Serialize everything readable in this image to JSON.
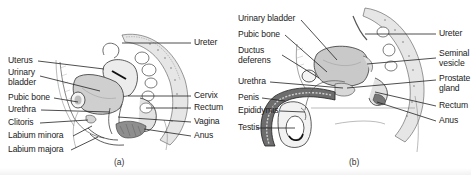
{
  "figure": {
    "panel_a": {
      "caption": "(a)",
      "subject": "female-pelvis-sagittal",
      "labels_left": [
        "Uterus",
        "Urinary bladder",
        "Pubic bone",
        "Urethra",
        "Clitoris",
        "Labium minora",
        "Labium majora"
      ],
      "labels_right": [
        "Ureter",
        "Cervix",
        "Rectum",
        "Vagina",
        "Anus"
      ],
      "urinary_line1": "Urinary",
      "urinary_line2": "bladder"
    },
    "panel_b": {
      "caption": "(b)",
      "subject": "male-pelvis-sagittal",
      "labels_left": [
        "Urinary bladder",
        "Pubic bone",
        "Ductus deferens",
        "Urethra",
        "Penis",
        "Epididymis",
        "Testis"
      ],
      "labels_right": [
        "Ureter",
        "Seminal vesicle",
        "Prostate gland",
        "Rectum",
        "Anus"
      ],
      "ductus_line1": "Ductus",
      "ductus_line2": "deferens",
      "seminal_line1": "Seminal",
      "seminal_line2": "vesicle",
      "prostate_line1": "Prostate",
      "prostate_line2": "gland"
    },
    "colors": {
      "ink": "#222222",
      "tissue_light": "#dcdcdc",
      "tissue_mid": "#a8a8a8",
      "tissue_dark": "#5a5a5a",
      "background": "#ffffff"
    }
  }
}
